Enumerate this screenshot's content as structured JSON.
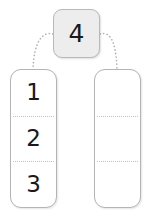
{
  "diagram": {
    "title": "4",
    "source_card": {
      "value": "4",
      "fill_color": "#ededed",
      "border_color": "#b9b9b9"
    },
    "connectors": [
      {
        "name": "connector-to-left-column",
        "style": "dotted",
        "color": "#b0b0b0"
      },
      {
        "name": "connector-to-right-column",
        "style": "dotted",
        "color": "#b0b0b0"
      }
    ],
    "columns": [
      {
        "name": "left-column",
        "cells": [
          {
            "value": "1",
            "empty": false
          },
          {
            "value": "2",
            "empty": false
          },
          {
            "value": "3",
            "empty": false
          }
        ]
      },
      {
        "name": "right-column",
        "cells": [
          {
            "value": "",
            "empty": true
          },
          {
            "value": "",
            "empty": true
          },
          {
            "value": "",
            "empty": true
          }
        ]
      }
    ],
    "colors": {
      "column_border": "#b4b4b4",
      "divider": "#c2c2c2",
      "text": "#1a1a1a",
      "background": "#ffffff"
    }
  }
}
